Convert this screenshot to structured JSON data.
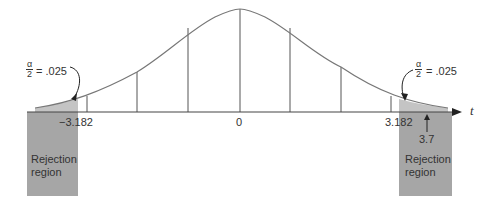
{
  "figure": {
    "type": "t-distribution two-tailed rejection region diagram",
    "axis_label": "t",
    "center_label": "0",
    "left_critical": "−3.182",
    "right_critical": "3.182",
    "observed_value": "3.7",
    "left_alpha": {
      "numerator": "α",
      "denominator": "2",
      "value": "= .025"
    },
    "right_alpha": {
      "numerator": "α",
      "denominator": "2",
      "value": "= .025"
    },
    "left_region": {
      "line1": "Rejection",
      "line2": "region"
    },
    "right_region": {
      "line1": "Rejection",
      "line2": "region"
    },
    "colors": {
      "region": "#a6a6a6",
      "tail": "#c8c8c8",
      "line": "#555555"
    }
  }
}
